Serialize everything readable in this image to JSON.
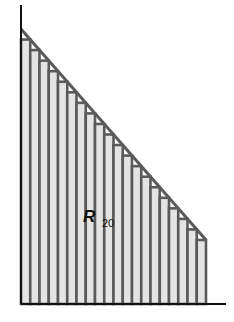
{
  "figure": {
    "label_main": "R",
    "label_sub": "20",
    "n_rectangles": 20,
    "colors": {
      "bar_fill": "#e4e4e4",
      "bar_stroke": "#5a5a5a",
      "line": "#5a5a5a",
      "axis": "#111111",
      "background": "#ffffff"
    },
    "geometry": {
      "origin_x": 21,
      "axis_y": 304,
      "axis_top_y": 5,
      "axis_right_x": 226,
      "line_start": [
        21,
        29
      ],
      "line_end": [
        206,
        240
      ]
    }
  }
}
